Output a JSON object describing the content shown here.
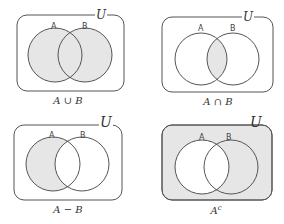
{
  "colors": {
    "shade": "#e6e6e6",
    "stroke": "#555555"
  },
  "diagrams": [
    {
      "operation": "union",
      "universe_label": "U",
      "set_a_label": "A",
      "set_b_label": "B",
      "caption": "A ∪ B",
      "shaded": [
        "A",
        "B"
      ]
    },
    {
      "operation": "intersection",
      "universe_label": "U",
      "set_a_label": "A",
      "set_b_label": "B",
      "caption": "A ∩ B",
      "shaded": [
        "A∩B"
      ]
    },
    {
      "operation": "difference",
      "universe_label": "U",
      "set_a_label": "A",
      "set_b_label": "B",
      "caption": "A − B",
      "shaded": [
        "A−B"
      ]
    },
    {
      "operation": "complement",
      "universe_label": "U",
      "set_a_label": "A",
      "set_b_label": "B",
      "caption": "A",
      "caption_sup": "c",
      "shaded": [
        "U−A"
      ]
    }
  ]
}
